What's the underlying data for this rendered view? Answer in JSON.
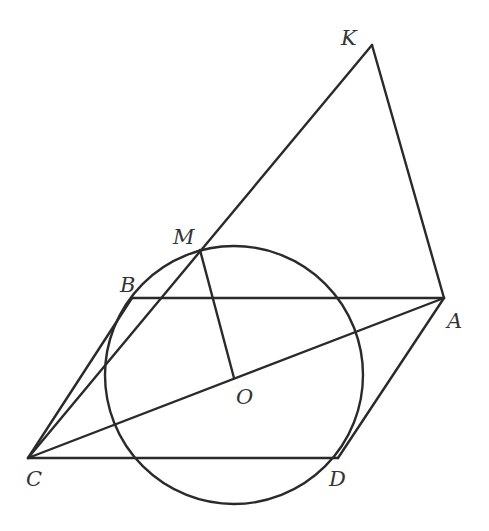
{
  "diagram": {
    "type": "geometry",
    "colors": {
      "stroke": "#2a2a2a",
      "label": "#333333",
      "background": "#ffffff"
    },
    "points": {
      "K": {
        "label": "K",
        "x": 372,
        "y": 45
      },
      "M": {
        "label": "M",
        "x": 200,
        "y": 250
      },
      "B": {
        "label": "B",
        "x": 132,
        "y": 298
      },
      "A": {
        "label": "A",
        "x": 444,
        "y": 298
      },
      "O": {
        "label": "O",
        "x": 234,
        "y": 378
      },
      "C": {
        "label": "C",
        "x": 28,
        "y": 458
      },
      "D": {
        "label": "D",
        "x": 338,
        "y": 458
      }
    },
    "circle": {
      "cx": 234,
      "cy": 375,
      "r": 129
    },
    "segments": [
      [
        "C",
        "K"
      ],
      [
        "K",
        "A"
      ],
      [
        "B",
        "A"
      ],
      [
        "C",
        "A"
      ],
      [
        "C",
        "B"
      ],
      [
        "C",
        "D"
      ],
      [
        "D",
        "A"
      ],
      [
        "M",
        "O"
      ]
    ],
    "labels": {
      "K": "K",
      "M": "M",
      "B": "B",
      "A": "A",
      "O": "O",
      "C": "C",
      "D": "D"
    }
  }
}
